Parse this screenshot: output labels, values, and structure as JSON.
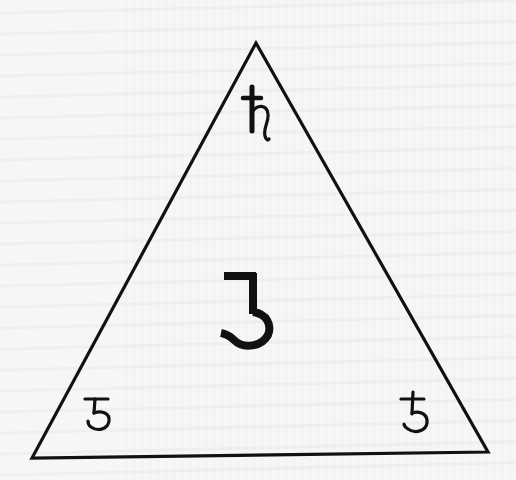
{
  "figure": {
    "shape": "triangle",
    "stroke_color": "#111111",
    "background_color": "#f6f6f4",
    "vertices": {
      "apex": [
        256,
        43
      ],
      "bottom_left": [
        32,
        458
      ],
      "bottom_right": [
        488,
        452
      ]
    },
    "symbols": [
      {
        "id": "top",
        "glyph": "♄",
        "description": "Saturn-like symbol near apex"
      },
      {
        "id": "center",
        "glyph": "ʒ",
        "description": "Large flat-topped three/ezh glyph in center"
      },
      {
        "id": "bottom_left",
        "glyph": "ʒ",
        "description": "Small flat-topped three glyph in lower-left corner"
      },
      {
        "id": "bottom_right",
        "glyph": "ƻ",
        "description": "Five-like glyph with crossbar in lower-right corner"
      }
    ]
  }
}
